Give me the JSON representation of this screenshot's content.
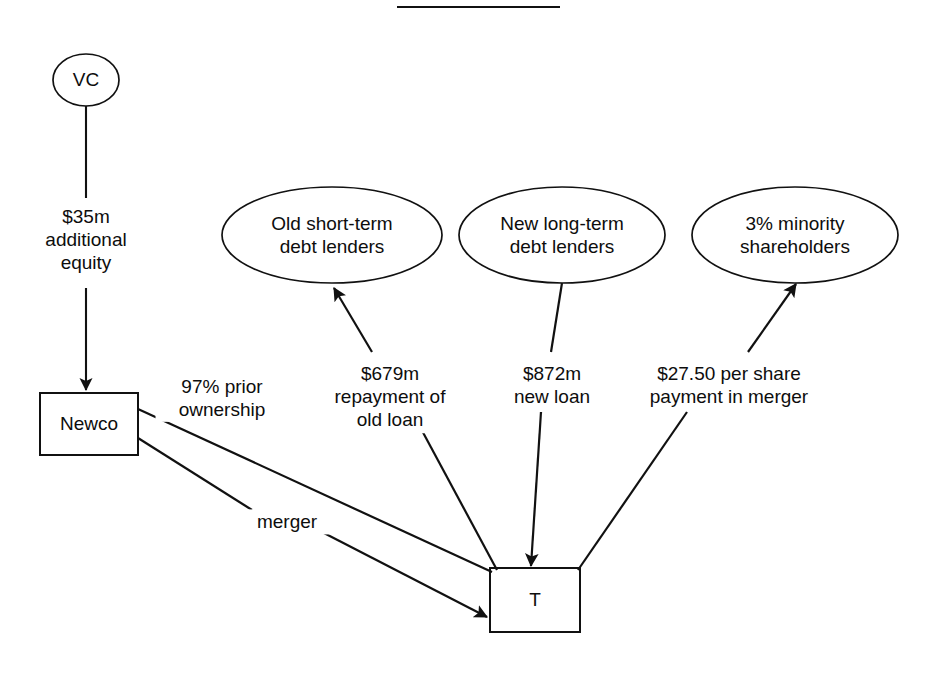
{
  "title": {
    "text": "Step 2 (continued)",
    "visible_partial": true
  },
  "diagram": {
    "type": "flow-diagram",
    "nodes": [
      {
        "id": "vc",
        "shape": "ellipse",
        "label": "VC",
        "cx": 86,
        "cy": 80,
        "rx": 33,
        "ry": 26
      },
      {
        "id": "old-debt",
        "shape": "ellipse",
        "label": "Old short-term\ndebt lenders",
        "cx": 332,
        "cy": 235,
        "rx": 110,
        "ry": 48
      },
      {
        "id": "new-debt",
        "shape": "ellipse",
        "label": "New long-term\ndebt lenders",
        "cx": 562,
        "cy": 235,
        "rx": 103,
        "ry": 48
      },
      {
        "id": "minority",
        "shape": "ellipse",
        "label": "3% minority\nshareholders",
        "cx": 795,
        "cy": 235,
        "rx": 103,
        "ry": 48
      },
      {
        "id": "newco",
        "shape": "rect",
        "label": "Newco",
        "x": 40,
        "y": 393,
        "w": 98,
        "h": 62
      },
      {
        "id": "target",
        "shape": "rect",
        "label": "T",
        "x": 490,
        "y": 568,
        "w": 90,
        "h": 64
      }
    ],
    "edges": [
      {
        "id": "vc-to-newco",
        "from": "vc",
        "to": "newco",
        "label": "$35m\nadditional\nequity",
        "label_x": 86,
        "label_y": 240,
        "arrow": "end"
      },
      {
        "id": "t-to-old-debt",
        "from": "target",
        "to": "old-debt",
        "label": "$679m\nrepayment of\nold loan",
        "label_x": 390,
        "label_y": 397,
        "arrow": "end"
      },
      {
        "id": "new-debt-to-t",
        "from": "new-debt",
        "to": "target",
        "label": "$872m\nnew loan",
        "label_x": 552,
        "label_y": 385,
        "arrow": "end"
      },
      {
        "id": "t-to-minority",
        "from": "target",
        "to": "minority",
        "label": "$27.50 per share\npayment in merger",
        "label_x": 729,
        "label_y": 385,
        "arrow": "end"
      },
      {
        "id": "newco-ownership-t",
        "from": "newco",
        "to": "target",
        "label": "97% prior\nownership",
        "label_x": 222,
        "label_y": 398,
        "arrow": "none"
      },
      {
        "id": "newco-merger-t",
        "from": "newco",
        "to": "target",
        "label": "merger",
        "label_x": 287,
        "label_y": 522,
        "arrow": "end"
      }
    ],
    "colors": {
      "stroke": "#111111",
      "text": "#0d0d0d",
      "background": "#ffffff"
    }
  }
}
